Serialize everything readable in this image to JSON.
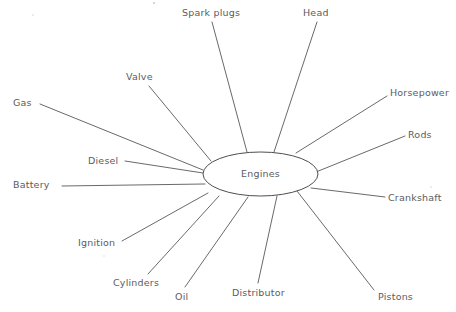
{
  "diagram": {
    "type": "concept-map-spider",
    "hub": {
      "label": "Engines",
      "shape": "ellipse",
      "cx": 260.5,
      "cy": 174,
      "rx": 57.5,
      "ry": 22,
      "label_x": 200.5,
      "label_y": 168
    },
    "line_color": "#58585a",
    "text_color": "#5c5c5e",
    "background_color": "#ffffff",
    "nodes": [
      {
        "id": "spark-plugs",
        "label": "Spark plugs",
        "label_x": 182,
        "label_y": 7,
        "line_x1": 212,
        "line_y1": 22,
        "line_x2": 247,
        "line_y2": 152
      },
      {
        "id": "head",
        "label": "Head",
        "label_x": 303,
        "label_y": 7,
        "line_x1": 317,
        "line_y1": 22,
        "line_x2": 274,
        "line_y2": 152
      },
      {
        "id": "valve",
        "label": "Valve",
        "label_x": 126,
        "label_y": 71,
        "line_x1": 149,
        "line_y1": 86,
        "line_x2": 211,
        "line_y2": 161
      },
      {
        "id": "horsepower",
        "label": "Horsepower",
        "label_x": 390,
        "label_y": 87,
        "line_x1": 387,
        "line_y1": 96,
        "line_x2": 296,
        "line_y2": 153
      },
      {
        "id": "gas",
        "label": "Gas",
        "label_x": 13,
        "label_y": 97,
        "line_x1": 40,
        "line_y1": 104,
        "line_x2": 203,
        "line_y2": 170
      },
      {
        "id": "rods",
        "label": "Rods",
        "label_x": 408,
        "label_y": 129,
        "line_x1": 405,
        "line_y1": 136,
        "line_x2": 316,
        "line_y2": 172
      },
      {
        "id": "diesel",
        "label": "Diesel",
        "label_x": 88,
        "label_y": 155,
        "line_x1": 125,
        "line_y1": 161,
        "line_x2": 203,
        "line_y2": 173
      },
      {
        "id": "battery",
        "label": "Battery",
        "label_x": 13,
        "label_y": 179,
        "line_x1": 62,
        "line_y1": 186,
        "line_x2": 205,
        "line_y2": 184
      },
      {
        "id": "crankshaft",
        "label": "Crankshaft",
        "label_x": 388,
        "label_y": 192,
        "line_x1": 385,
        "line_y1": 197,
        "line_x2": 311,
        "line_y2": 188
      },
      {
        "id": "ignition",
        "label": "Ignition",
        "label_x": 78,
        "label_y": 237,
        "line_x1": 122,
        "line_y1": 241,
        "line_x2": 208,
        "line_y2": 193
      },
      {
        "id": "cylinders",
        "label": "Cylinders",
        "label_x": 113,
        "label_y": 277,
        "line_x1": 148,
        "line_y1": 274,
        "line_x2": 219,
        "line_y2": 196
      },
      {
        "id": "oil",
        "label": "Oil",
        "label_x": 175,
        "label_y": 291,
        "line_x1": 185,
        "line_y1": 287,
        "line_x2": 248,
        "line_y2": 197
      },
      {
        "id": "distributor",
        "label": "Distributor",
        "label_x": 232,
        "label_y": 287,
        "line_x1": 258,
        "line_y1": 283,
        "line_x2": 277,
        "line_y2": 196
      },
      {
        "id": "pistons",
        "label": "Pistons",
        "label_x": 378,
        "label_y": 291,
        "line_x1": 374,
        "line_y1": 290,
        "line_x2": 297,
        "line_y2": 191
      }
    ]
  }
}
